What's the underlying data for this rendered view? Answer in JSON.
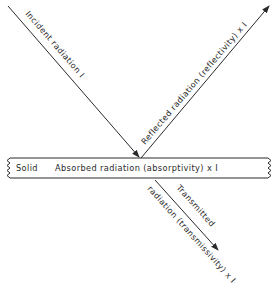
{
  "diagram": {
    "colors": {
      "ink": "#2a2a2a",
      "background": "#ffffff"
    },
    "solid": {
      "label": "Solid",
      "absorbed_label": "Absorbed radiation (absorptivity) x I"
    },
    "rays": {
      "incident": {
        "label": "Incident radiation  I"
      },
      "reflected": {
        "label": "Reflected radiation (reflectivity) x I"
      },
      "transmitted": {
        "label_line1": "Transmitted",
        "label_line2": "radiation (transmissivity) x I"
      }
    }
  }
}
